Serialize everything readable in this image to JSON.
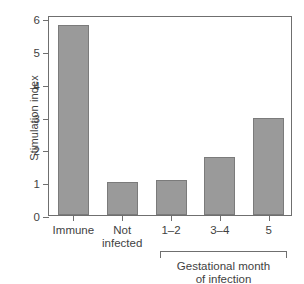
{
  "chart_data": {
    "type": "bar",
    "title": "",
    "xlabel": "",
    "ylabel": "Stimulation index",
    "categories": [
      "Immune",
      "Not\ninfected",
      "1–2",
      "3–4",
      "5"
    ],
    "values": [
      5.8,
      1.0,
      1.08,
      1.76,
      2.97
    ],
    "ylim": [
      0,
      6.1
    ],
    "yticks": [
      0,
      1,
      2,
      3,
      4,
      5,
      6
    ],
    "ytick_labels": [
      "0",
      "1",
      "2",
      "3",
      "4",
      "5",
      "6"
    ],
    "grid": false,
    "legend": null,
    "annotations": [
      {
        "type": "group-bracket",
        "label": "Gestational month\nof infection",
        "spans_categories": [
          "1–2",
          "3–4",
          "5"
        ]
      }
    ],
    "colors": {
      "bar_fill": "#9a9a9a",
      "bar_edge": "#7b7b7b",
      "axis": "#6f6f6f",
      "text": "#3f3f3f",
      "background": "#ffffff"
    }
  },
  "group_annotation": {
    "label_line1": "Gestational month",
    "label_line2": "of infection"
  }
}
